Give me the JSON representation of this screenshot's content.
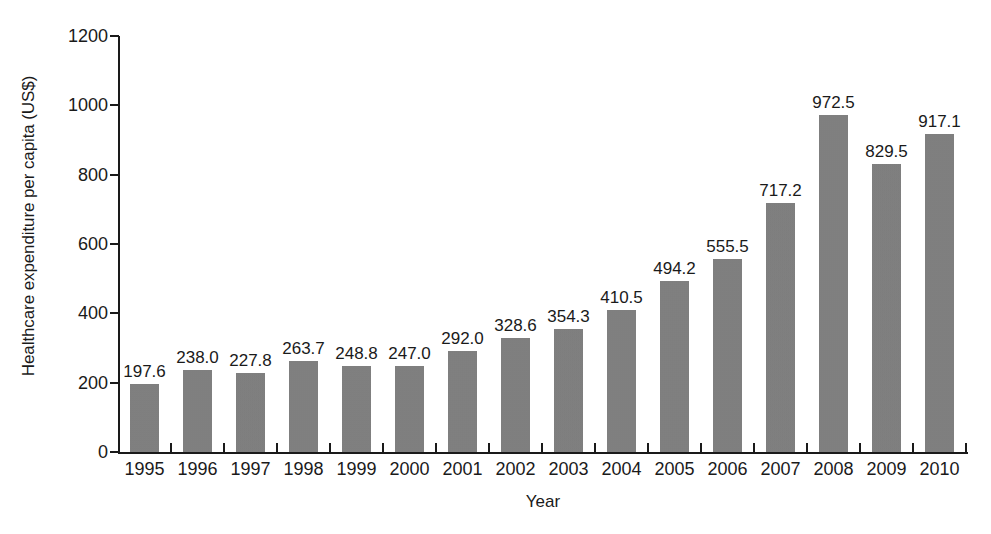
{
  "chart_data": {
    "type": "bar",
    "title": "",
    "xlabel": "Year",
    "ylabel": "Healthcare expenditure per capita (US$)",
    "categories": [
      "1995",
      "1996",
      "1997",
      "1998",
      "1999",
      "2000",
      "2001",
      "2002",
      "2003",
      "2004",
      "2005",
      "2006",
      "2007",
      "2008",
      "2009",
      "2010"
    ],
    "values": [
      197.6,
      238.0,
      227.8,
      263.7,
      248.8,
      247.0,
      292.0,
      328.6,
      354.3,
      410.5,
      494.2,
      555.5,
      717.2,
      972.5,
      829.5,
      917.1
    ],
    "value_labels": [
      "197.6",
      "238.0",
      "227.8",
      "263.7",
      "248.8",
      "247.0",
      "292.0",
      "328.6",
      "354.3",
      "410.5",
      "494.2",
      "555.5",
      "717.2",
      "972.5",
      "829.5",
      "917.1"
    ],
    "ylim": [
      0,
      1200
    ],
    "yticks": [
      0,
      200,
      400,
      600,
      800,
      1000,
      1200
    ],
    "ytick_labels": [
      "0",
      "200",
      "400",
      "600",
      "800",
      "1000",
      "1200"
    ],
    "grid": false,
    "legend": null,
    "bar_color": "#7e7e7e",
    "axis_color": "#1a1a1a",
    "background_color": "#ffffff"
  }
}
